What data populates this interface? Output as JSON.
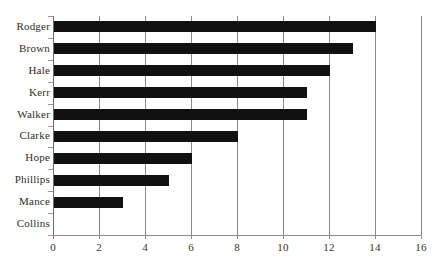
{
  "chart_data": {
    "type": "bar",
    "orientation": "horizontal",
    "title": "",
    "subtitle": "",
    "xlabel": "",
    "ylabel": "",
    "categories": [
      "Rodger",
      "Brown",
      "Hale",
      "Kerr",
      "Walker",
      "Clarke",
      "Hope",
      "Phillips",
      "Mance",
      "Collins"
    ],
    "values": [
      14,
      13,
      12,
      11,
      11,
      8,
      6,
      5,
      3,
      0
    ],
    "xlim": [
      0,
      16
    ],
    "xticks": [
      0,
      2,
      4,
      6,
      8,
      10,
      12,
      14,
      16
    ],
    "xtick_labels": [
      "0",
      "2",
      "4",
      "6",
      "8",
      "10",
      "12",
      "14",
      "16"
    ],
    "grid": "vertical",
    "legend": "none",
    "bar_color": "#111111",
    "grid_color": "#8a8a8a",
    "background_color": "#ffffff",
    "text_color": "#2e2d2a"
  }
}
